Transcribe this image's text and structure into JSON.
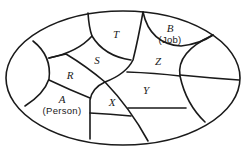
{
  "diagram": {
    "type": "venn-style partition diagram",
    "stroke_color": "#1a1a1a",
    "background": "#ffffff",
    "boundary": "ellipse",
    "regions": [
      {
        "id": "T",
        "letter": "T",
        "sublabel": "",
        "x": 116,
        "y": 34
      },
      {
        "id": "B",
        "letter": "B",
        "sublabel": "(Job)",
        "x": 170,
        "y": 29
      },
      {
        "id": "S",
        "letter": "S",
        "sublabel": "",
        "x": 97,
        "y": 60
      },
      {
        "id": "Z",
        "letter": "Z",
        "sublabel": "",
        "x": 158,
        "y": 61
      },
      {
        "id": "R",
        "letter": "R",
        "sublabel": "",
        "x": 70,
        "y": 75
      },
      {
        "id": "Y",
        "letter": "Y",
        "sublabel": "",
        "x": 146,
        "y": 90
      },
      {
        "id": "A",
        "letter": "A",
        "sublabel": "(Person)",
        "x": 62,
        "y": 105
      },
      {
        "id": "X",
        "letter": "X",
        "sublabel": "",
        "x": 112,
        "y": 102
      }
    ]
  }
}
